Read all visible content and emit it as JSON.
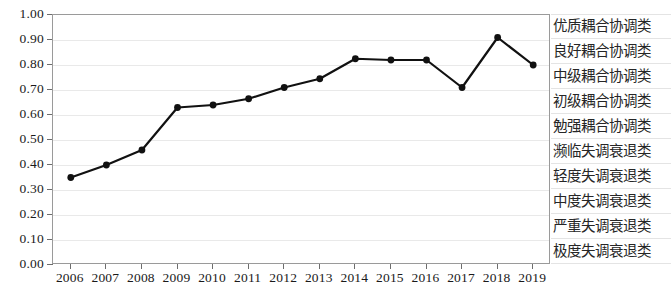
{
  "chart_data": {
    "type": "line",
    "title": "",
    "subtitle": "",
    "xlabel": "",
    "ylabel": "",
    "x": [
      2006,
      2007,
      2008,
      2009,
      2010,
      2011,
      2012,
      2013,
      2014,
      2015,
      2016,
      2017,
      2018,
      2019
    ],
    "categories": [
      "2006",
      "2007",
      "2008",
      "2009",
      "2010",
      "2011",
      "2012",
      "2013",
      "2014",
      "2015",
      "2016",
      "2017",
      "2018",
      "2019"
    ],
    "values": [
      0.35,
      0.4,
      0.46,
      0.63,
      0.64,
      0.665,
      0.71,
      0.745,
      0.825,
      0.82,
      0.82,
      0.71,
      0.91,
      0.8
    ],
    "series": [
      {
        "name": "耦合协调度",
        "values": [
          0.35,
          0.4,
          0.46,
          0.63,
          0.64,
          0.665,
          0.71,
          0.745,
          0.825,
          0.82,
          0.82,
          0.71,
          0.91,
          0.8
        ]
      }
    ],
    "ylim": [
      0.0,
      1.0
    ],
    "ytick_values": [
      1.0,
      0.9,
      0.8,
      0.7,
      0.6,
      0.5,
      0.4,
      0.3,
      0.2,
      0.1,
      0.0
    ],
    "ytick_labels": [
      "1.00",
      "0.90",
      "0.80",
      "0.70",
      "0.60",
      "0.50",
      "0.40",
      "0.30",
      "0.20",
      "0.10",
      "0.00"
    ],
    "grid": true,
    "grid_axis": "y",
    "legend": "none",
    "line_color": "#111111",
    "marker": "circle",
    "marker_color": "#111111",
    "category_bands": [
      {
        "label": "优质耦合协调类",
        "range": [
          0.9,
          1.0
        ]
      },
      {
        "label": "良好耦合协调类",
        "range": [
          0.8,
          0.9
        ]
      },
      {
        "label": "中级耦合协调类",
        "range": [
          0.7,
          0.8
        ]
      },
      {
        "label": "初级耦合协调类",
        "range": [
          0.6,
          0.7
        ]
      },
      {
        "label": "勉强耦合协调类",
        "range": [
          0.5,
          0.6
        ]
      },
      {
        "label": "濒临失调衰退类",
        "range": [
          0.4,
          0.5
        ]
      },
      {
        "label": "轻度失调衰退类",
        "range": [
          0.3,
          0.4
        ]
      },
      {
        "label": "中度失调衰退类",
        "range": [
          0.2,
          0.3
        ]
      },
      {
        "label": "严重失调衰退类",
        "range": [
          0.1,
          0.2
        ]
      },
      {
        "label": "极度失调衰退类",
        "range": [
          0.0,
          0.1
        ]
      }
    ]
  },
  "colors": {
    "line": "#111111",
    "gridline": "#e9e9e9",
    "frame": "#9a9a9a",
    "tick": "#6d6d6d",
    "text": "#1a1a1a",
    "band_text": "#262626"
  }
}
